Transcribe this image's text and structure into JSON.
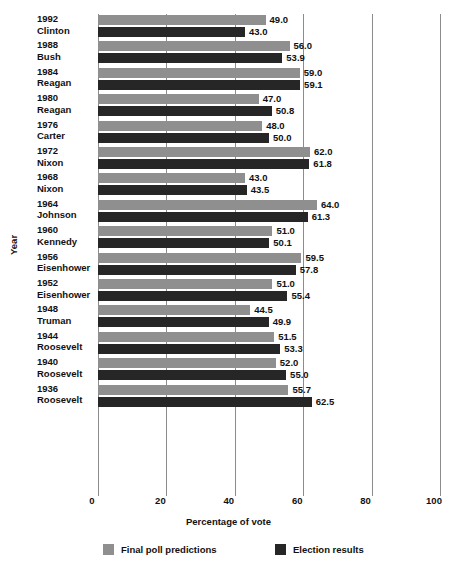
{
  "chart_data": {
    "type": "bar",
    "orientation": "horizontal",
    "title": "",
    "xlabel": "Percentage of vote",
    "ylabel": "Year",
    "xlim": [
      0,
      100
    ],
    "xticks": [
      0,
      20,
      40,
      60,
      80,
      100
    ],
    "xtick_labels": [
      "0",
      "20",
      "40",
      "60",
      "80",
      "100"
    ],
    "grid": true,
    "grid_axis": "x",
    "legend_position": "bottom",
    "categories": [
      "1992 Clinton",
      "1988 Bush",
      "1984 Reagan",
      "1980 Reagan",
      "1976 Carter",
      "1972 Nixon",
      "1968 Nixon",
      "1964 Johnson",
      "1960 Kennedy",
      "1956 Eisenhower",
      "1952 Eisenhower",
      "1948 Truman",
      "1944 Roosevelt",
      "1940 Roosevelt",
      "1936 Roosevelt"
    ],
    "series": [
      {
        "name": "Final poll predictions",
        "color": "#8f8f8f",
        "values": [
          49.0,
          56.0,
          59.0,
          47.0,
          48.0,
          62.0,
          43.0,
          64.0,
          51.0,
          59.5,
          51.0,
          44.5,
          51.5,
          52.0,
          55.7
        ]
      },
      {
        "name": "Election results",
        "color": "#262626",
        "values": [
          43.0,
          53.9,
          59.1,
          50.8,
          50.0,
          61.8,
          43.5,
          61.3,
          50.1,
          57.8,
          55.4,
          49.9,
          53.3,
          55.0,
          62.5
        ]
      }
    ],
    "value_labels": {
      "poll": [
        "49.0",
        "56.0",
        "59.0",
        "47.0",
        "48.0",
        "62.0",
        "43.0",
        "64.0",
        "51.0",
        "59.5",
        "51.0",
        "44.5",
        "51.5",
        "52.0",
        "55.7"
      ],
      "result": [
        "43.0",
        "53.9",
        "59.1",
        "50.8",
        "50.0",
        "61.8",
        "43.5",
        "61.3",
        "50.1",
        "57.8",
        "55.4",
        "49.9",
        "53.3",
        "55.0",
        "62.5"
      ]
    }
  },
  "rows": [
    {
      "year": "1992",
      "name": "Clinton",
      "poll": 49.0,
      "result": 43.0,
      "poll_label": "49.0",
      "result_label": "43.0"
    },
    {
      "year": "1988",
      "name": "Bush",
      "poll": 56.0,
      "result": 53.9,
      "poll_label": "56.0",
      "result_label": "53.9"
    },
    {
      "year": "1984",
      "name": "Reagan",
      "poll": 59.0,
      "result": 59.1,
      "poll_label": "59.0",
      "result_label": "59.1"
    },
    {
      "year": "1980",
      "name": "Reagan",
      "poll": 47.0,
      "result": 50.8,
      "poll_label": "47.0",
      "result_label": "50.8"
    },
    {
      "year": "1976",
      "name": "Carter",
      "poll": 48.0,
      "result": 50.0,
      "poll_label": "48.0",
      "result_label": "50.0"
    },
    {
      "year": "1972",
      "name": "Nixon",
      "poll": 62.0,
      "result": 61.8,
      "poll_label": "62.0",
      "result_label": "61.8"
    },
    {
      "year": "1968",
      "name": "Nixon",
      "poll": 43.0,
      "result": 43.5,
      "poll_label": "43.0",
      "result_label": "43.5"
    },
    {
      "year": "1964",
      "name": "Johnson",
      "poll": 64.0,
      "result": 61.3,
      "poll_label": "64.0",
      "result_label": "61.3"
    },
    {
      "year": "1960",
      "name": "Kennedy",
      "poll": 51.0,
      "result": 50.1,
      "poll_label": "51.0",
      "result_label": "50.1"
    },
    {
      "year": "1956",
      "name": "Eisenhower",
      "poll": 59.5,
      "result": 57.8,
      "poll_label": "59.5",
      "result_label": "57.8"
    },
    {
      "year": "1952",
      "name": "Eisenhower",
      "poll": 51.0,
      "result": 55.4,
      "poll_label": "51.0",
      "result_label": "55.4"
    },
    {
      "year": "1948",
      "name": "Truman",
      "poll": 44.5,
      "result": 49.9,
      "poll_label": "44.5",
      "result_label": "49.9"
    },
    {
      "year": "1944",
      "name": "Roosevelt",
      "poll": 51.5,
      "result": 53.3,
      "poll_label": "51.5",
      "result_label": "53.3"
    },
    {
      "year": "1940",
      "name": "Roosevelt",
      "poll": 52.0,
      "result": 55.0,
      "poll_label": "52.0",
      "result_label": "55.0"
    },
    {
      "year": "1936",
      "name": "Roosevelt",
      "poll": 55.7,
      "result": 62.5,
      "poll_label": "55.7",
      "result_label": "62.5"
    }
  ],
  "axes": {
    "x_title": "Percentage of vote",
    "y_title": "Year",
    "xticks": [
      "0",
      "20",
      "40",
      "60",
      "80",
      "100"
    ]
  },
  "legend": [
    {
      "label": "Final poll predictions",
      "color": "#8f8f8f"
    },
    {
      "label": "Election results",
      "color": "#262626"
    }
  ],
  "colors": {
    "poll": "#8f8f8f",
    "result": "#262626",
    "grid": "#8c8c8c",
    "text": "#111111",
    "background": "#ffffff"
  }
}
